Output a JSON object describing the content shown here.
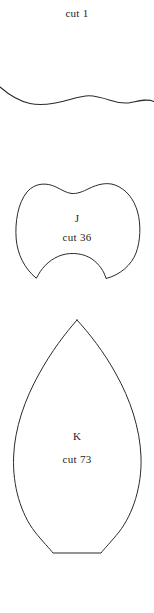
{
  "sheet": {
    "background_color": "#ffffff",
    "stroke_color": "#2a2a2a",
    "width": 154,
    "height": 613
  },
  "pieces": [
    {
      "id": "wave",
      "name_label": "",
      "quantity_label": "cut 1",
      "shape": "wavy-line",
      "quantity": 1
    },
    {
      "id": "j",
      "name_label": "J",
      "quantity_label": "cut 36",
      "shape": "lobed-heart",
      "quantity": 36
    },
    {
      "id": "k",
      "name_label": "K",
      "quantity_label": "cut 73",
      "shape": "pointed-petal",
      "quantity": 73
    }
  ]
}
